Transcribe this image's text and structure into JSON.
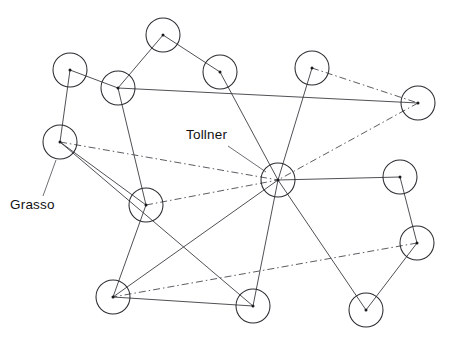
{
  "diagram": {
    "type": "node-link-network",
    "background_color": "#ffffff",
    "node_stroke_color": "#2b2b30",
    "node_dot_color": "#1a1a1d",
    "edge_color": "#3c3c42",
    "dashed_edge_color": "#4a4a50",
    "label_color": "#111114",
    "node_radius": 17
  },
  "nodes": [
    {
      "id": "n1",
      "name": "node-top-left",
      "x": 70,
      "y": 70
    },
    {
      "id": "n2",
      "name": "node-upper-mid-left",
      "x": 118,
      "y": 88
    },
    {
      "id": "n3",
      "name": "node-top-center",
      "x": 163,
      "y": 35
    },
    {
      "id": "n4",
      "name": "node-top-right-inner",
      "x": 220,
      "y": 72
    },
    {
      "id": "n5",
      "name": "node-top-right",
      "x": 312,
      "y": 68
    },
    {
      "id": "n6",
      "name": "node-far-right-upper",
      "x": 418,
      "y": 103
    },
    {
      "id": "n7",
      "name": "node-grasso",
      "x": 60,
      "y": 142
    },
    {
      "id": "n8",
      "name": "node-mid-left",
      "x": 146,
      "y": 205
    },
    {
      "id": "n9",
      "name": "node-tollner-hub",
      "x": 278,
      "y": 180
    },
    {
      "id": "n10",
      "name": "node-right-mid",
      "x": 400,
      "y": 177
    },
    {
      "id": "n11",
      "name": "node-right-lower",
      "x": 417,
      "y": 243
    },
    {
      "id": "n12",
      "name": "node-bottom-left",
      "x": 113,
      "y": 297
    },
    {
      "id": "n13",
      "name": "node-bottom-center",
      "x": 253,
      "y": 306
    },
    {
      "id": "n14",
      "name": "node-bottom-right",
      "x": 366,
      "y": 310
    }
  ],
  "edges": [
    {
      "from": "n1",
      "to": "n2",
      "style": "solid"
    },
    {
      "from": "n1",
      "to": "n7",
      "style": "solid"
    },
    {
      "from": "n2",
      "to": "n3",
      "style": "solid"
    },
    {
      "from": "n2",
      "to": "n6",
      "style": "solid"
    },
    {
      "from": "n2",
      "to": "n8",
      "style": "solid"
    },
    {
      "from": "n3",
      "to": "n4",
      "style": "solid"
    },
    {
      "from": "n4",
      "to": "n9",
      "style": "solid"
    },
    {
      "from": "n5",
      "to": "n9",
      "style": "solid"
    },
    {
      "from": "n5",
      "to": "n6",
      "style": "dashdot"
    },
    {
      "from": "n6",
      "to": "n9",
      "style": "dashdot"
    },
    {
      "from": "n7",
      "to": "n9",
      "style": "dashdot"
    },
    {
      "from": "n7",
      "to": "n8",
      "style": "solid"
    },
    {
      "from": "n7",
      "to": "n13",
      "style": "solid"
    },
    {
      "from": "n8",
      "to": "n9",
      "style": "dashdot"
    },
    {
      "from": "n8",
      "to": "n12",
      "style": "solid"
    },
    {
      "from": "n9",
      "to": "n10",
      "style": "solid"
    },
    {
      "from": "n9",
      "to": "n12",
      "style": "solid"
    },
    {
      "from": "n9",
      "to": "n13",
      "style": "solid"
    },
    {
      "from": "n9",
      "to": "n14",
      "style": "solid"
    },
    {
      "from": "n10",
      "to": "n11",
      "style": "solid"
    },
    {
      "from": "n11",
      "to": "n12",
      "style": "dashdot"
    },
    {
      "from": "n11",
      "to": "n14",
      "style": "solid"
    },
    {
      "from": "n12",
      "to": "n13",
      "style": "solid"
    }
  ],
  "labels": [
    {
      "id": "lbl-tollner",
      "name": "label-tollner",
      "text": "Tollner",
      "x": 186,
      "y": 139,
      "anchor": "start",
      "leader": {
        "x1": 228,
        "y1": 146,
        "x2": 266,
        "y2": 172
      }
    },
    {
      "id": "lbl-grasso",
      "name": "label-grasso",
      "text": "Grasso",
      "x": 10,
      "y": 209,
      "anchor": "start",
      "leader": {
        "x1": 43,
        "y1": 196,
        "x2": 56,
        "y2": 160
      }
    }
  ]
}
